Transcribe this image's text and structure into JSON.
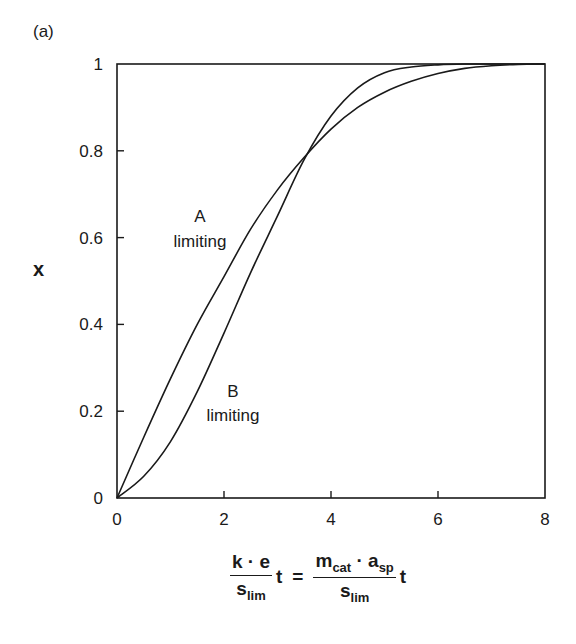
{
  "panel_label": "(a)",
  "chart_data": {
    "type": "line",
    "title": "",
    "xlabel": "k·e/s_lim t = m_cat·a_sp/s_lim t",
    "ylabel": "x",
    "xlim": [
      0,
      8
    ],
    "ylim": [
      0,
      1
    ],
    "xticks": [
      0,
      2,
      4,
      6,
      8
    ],
    "yticks": [
      0,
      0.2,
      0.4,
      0.6,
      0.8,
      1
    ],
    "ytick_labels": [
      "0",
      "0.2",
      "0.4",
      "0.6",
      "0.8",
      "1"
    ],
    "grid": false,
    "legend": null,
    "series": [
      {
        "name": "A limiting",
        "x": [
          0,
          0.5,
          1.0,
          1.5,
          2.0,
          2.5,
          3.0,
          3.5,
          4.0,
          4.5,
          5.0,
          5.5,
          6.0,
          6.5,
          7.0,
          7.5,
          8.0
        ],
        "y": [
          0,
          0.14,
          0.275,
          0.4,
          0.51,
          0.62,
          0.71,
          0.785,
          0.85,
          0.9,
          0.935,
          0.96,
          0.978,
          0.99,
          0.996,
          0.999,
          1.0
        ]
      },
      {
        "name": "B limiting",
        "x": [
          0,
          0.5,
          1.0,
          1.5,
          2.0,
          2.5,
          3.0,
          3.5,
          4.0,
          4.5,
          5.0,
          5.5,
          6.0,
          6.5,
          7.0,
          7.5,
          8.0
        ],
        "y": [
          0,
          0.05,
          0.13,
          0.245,
          0.38,
          0.52,
          0.65,
          0.78,
          0.88,
          0.945,
          0.98,
          0.993,
          0.998,
          1.0,
          1.0,
          1.0,
          1.0
        ]
      }
    ],
    "annotations": [
      {
        "text": "A\nlimiting",
        "x": 1.75,
        "y": 0.63
      },
      {
        "text": "B\nlimiting",
        "x": 2.4,
        "y": 0.21
      }
    ]
  },
  "labels": {
    "y_axis": "x",
    "x_axis": {
      "left_num": "k · e",
      "left_den_base": "s",
      "left_den_sub": "lim",
      "t1": "t",
      "equals": "=",
      "right_num_m": "m",
      "right_num_m_sub": "cat",
      "right_num_dot": " · ",
      "right_num_a": "a",
      "right_num_a_sub": "sp",
      "right_den_base": "s",
      "right_den_sub": "lim",
      "t2": "t"
    },
    "annot_a_line1": "A",
    "annot_a_line2": "limiting",
    "annot_b_line1": "B",
    "annot_b_line2": "limiting"
  }
}
